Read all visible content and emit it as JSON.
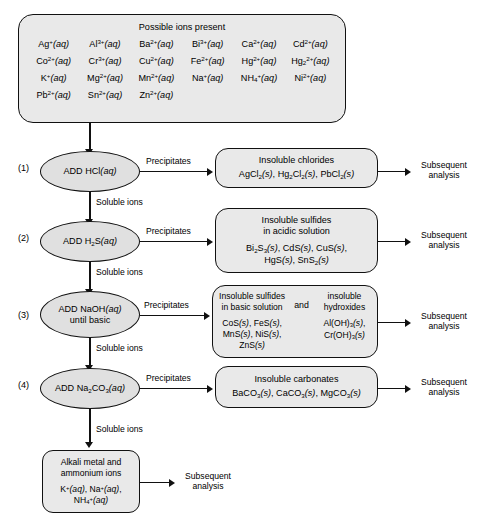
{
  "diagram": {
    "ions_box": {
      "header": "Possible ions present",
      "ions": [
        "Ag+(aq)",
        "Al3+(aq)",
        "Ba2+(aq)",
        "Bi3+(aq)",
        "Ca2+(aq)",
        "Cd2+(aq)",
        "Co2+(aq)",
        "Cr3+(aq)",
        "Cu2+(aq)",
        "Fe2+(aq)",
        "Hg2+(aq)",
        "Hg2 2+(aq)",
        "K+(aq)",
        "Mg2+(aq)",
        "Mn2+(aq)",
        "Na+(aq)",
        "NH4+(aq)",
        "Ni2+(aq)",
        "Pb2+(aq)",
        "Sn2+(aq)",
        "Zn2+(aq)"
      ]
    },
    "edge_labels": {
      "precipitates": "Precipitates",
      "soluble_ions": "Soluble ions",
      "subsequent_analysis_line1": "Subsequent",
      "subsequent_analysis_line2": "analysis",
      "and": "and"
    },
    "steps": [
      {
        "number": "(1)",
        "reagent_line1": "ADD HCl(aq)",
        "reagent_line2": "",
        "product_heading": "Insoluble chlorides",
        "product_formulas": [
          "AgCl2(s), Hg2Cl2(s), PbCl2(s)"
        ]
      },
      {
        "number": "(2)",
        "reagent_line1": "ADD H2S(aq)",
        "reagent_line2": "",
        "product_heading_line1": "Insoluble sulfides",
        "product_heading_line2": "in acidic solution",
        "product_formulas": [
          "Bi2S3(s), CdS(s), CuS(s),",
          "HgS(s), SnS2(s)"
        ]
      },
      {
        "number": "(3)",
        "reagent_line1": "ADD NaOH(aq)",
        "reagent_line2": "until basic",
        "left_heading_line1": "Insoluble sulfides",
        "left_heading_line2": "in basic solution",
        "left_formulas": [
          "CoS(s), FeS(s),",
          "MnS(s), NiS(s),",
          "ZnS(s)"
        ],
        "right_heading_line1": "insoluble",
        "right_heading_line2": "hydroxides",
        "right_formulas": [
          "Al(OH)3(s),",
          "Cr(OH)3(s)"
        ]
      },
      {
        "number": "(4)",
        "reagent_line1": "ADD Na2CO3(aq)",
        "reagent_line2": "",
        "product_heading": "Insoluble carbonates",
        "product_formulas": [
          "BaCO3(s), CaCO3(s), MgCO3(s)"
        ]
      }
    ],
    "final_box": {
      "heading_line1": "Alkali metal and",
      "heading_line2": "ammonium ions",
      "formulas": [
        "K+(aq), Na+(aq),",
        "NH4+(aq)"
      ]
    },
    "colors": {
      "box_fill": "#e9e9e9",
      "ellipse_fill": "#e0e0e0",
      "stroke": "#111111",
      "background": "#ffffff"
    }
  }
}
